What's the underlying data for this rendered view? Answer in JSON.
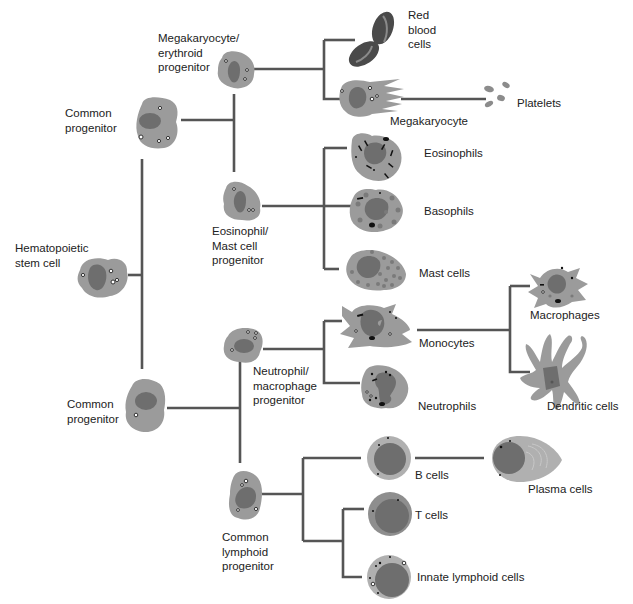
{
  "colors": {
    "connector": "#555555",
    "cytoplasm": "#9b9b9b",
    "nucleus": "#6e6e6e",
    "rbc": "#4a4a4a",
    "lymphocyte_rim": "#b0b0b0",
    "background": "#ffffff"
  },
  "nodes": {
    "hsc": {
      "label": "Hematopoietic\nstem cell"
    },
    "common_progenitor_myeloid": {
      "label": "Common\nprogenitor"
    },
    "common_progenitor_lower": {
      "label": "Common\nprogenitor"
    },
    "mk_ery_progenitor": {
      "label": "Megakaryocyte/\nerythroid\nprogenitor"
    },
    "eos_mast_progenitor": {
      "label": "Eosinophil/\nMast cell\nprogenitor"
    },
    "neut_mac_progenitor": {
      "label": "Neutrophil/\nmacrophage\nprogenitor"
    },
    "common_lymphoid_progenitor": {
      "label": "Common\nlymphoid\nprogenitor"
    },
    "red_blood_cells": {
      "label": "Red\nblood\ncells"
    },
    "megakaryocyte": {
      "label": "Megakaryocyte"
    },
    "platelets": {
      "label": "Platelets"
    },
    "eosinophils": {
      "label": "Eosinophils"
    },
    "basophils": {
      "label": "Basophils"
    },
    "mast_cells": {
      "label": "Mast cells"
    },
    "monocytes": {
      "label": "Monocytes"
    },
    "neutrophils": {
      "label": "Neutrophils"
    },
    "macrophages": {
      "label": "Macrophages"
    },
    "dendritic_cells": {
      "label": "Dendritic cells"
    },
    "b_cells": {
      "label": "B   cells"
    },
    "t_cells": {
      "label": "T   cells"
    },
    "plasma_cells": {
      "label": "Plasma cells"
    },
    "innate_lymphoid_cells": {
      "label": "Innate lymphoid cells"
    }
  },
  "edges": [
    [
      "hsc",
      "common_progenitor_myeloid"
    ],
    [
      "hsc",
      "common_progenitor_lower"
    ],
    [
      "common_progenitor_myeloid",
      "mk_ery_progenitor"
    ],
    [
      "common_progenitor_myeloid",
      "eos_mast_progenitor"
    ],
    [
      "mk_ery_progenitor",
      "red_blood_cells"
    ],
    [
      "mk_ery_progenitor",
      "megakaryocyte"
    ],
    [
      "megakaryocyte",
      "platelets"
    ],
    [
      "eos_mast_progenitor",
      "eosinophils"
    ],
    [
      "eos_mast_progenitor",
      "basophils"
    ],
    [
      "eos_mast_progenitor",
      "mast_cells"
    ],
    [
      "common_progenitor_lower",
      "neut_mac_progenitor"
    ],
    [
      "common_progenitor_lower",
      "common_lymphoid_progenitor"
    ],
    [
      "neut_mac_progenitor",
      "monocytes"
    ],
    [
      "neut_mac_progenitor",
      "neutrophils"
    ],
    [
      "monocytes",
      "macrophages"
    ],
    [
      "monocytes",
      "dendritic_cells"
    ],
    [
      "common_lymphoid_progenitor",
      "b_cells"
    ],
    [
      "common_lymphoid_progenitor",
      "t_cells"
    ],
    [
      "common_lymphoid_progenitor",
      "innate_lymphoid_cells"
    ],
    [
      "b_cells",
      "plasma_cells"
    ]
  ]
}
